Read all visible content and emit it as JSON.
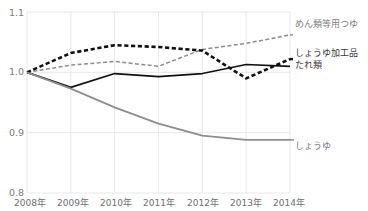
{
  "chart_data": {
    "type": "line",
    "title": "",
    "xlabel": "",
    "ylabel": "",
    "x": [
      "2008年",
      "2009年",
      "2010年",
      "2011年",
      "2012年",
      "2013年",
      "2014年"
    ],
    "ylim": [
      0.8,
      1.1
    ],
    "yticks": [
      0.8,
      0.9,
      1.0,
      1.1
    ],
    "ytick_labels": [
      "0.8",
      "0.9",
      "1.0",
      "1.1"
    ],
    "grid": true,
    "legend_position": "right-inline",
    "series": [
      {
        "name": "めん類等用つゆ",
        "style": "dashed",
        "color": "#8d8d8d",
        "values": [
          1.0,
          1.012,
          1.018,
          1.01,
          1.038,
          1.048,
          1.062
        ]
      },
      {
        "name": "しょうゆ加工品\nたれ類",
        "label_line1": "しょうゆ加工品",
        "label_line2": "たれ類",
        "style": "dashed-bold",
        "color": "#111111",
        "values": [
          1.0,
          1.032,
          1.045,
          1.042,
          1.036,
          0.99,
          1.022
        ]
      },
      {
        "name": "たれ類",
        "style": "solid",
        "color": "#111111",
        "values": [
          1.0,
          0.975,
          0.998,
          0.993,
          0.998,
          1.013,
          1.01
        ]
      },
      {
        "name": "しょうゆ",
        "style": "solid",
        "color": "#8d8d8d",
        "values": [
          1.0,
          0.973,
          0.942,
          0.915,
          0.895,
          0.888,
          0.888
        ]
      }
    ]
  },
  "axis": {
    "y_labels": [
      "1.1",
      "1.0",
      "0.9",
      "0.8"
    ],
    "x_labels": [
      "2008年",
      "2009年",
      "2010年",
      "2011年",
      "2012年",
      "2013年",
      "2014年"
    ]
  },
  "legend": {
    "men_tsuyu": "めん類等用つゆ",
    "shoyu_kakoHin": "しょうゆ加工品",
    "tare_rui": "たれ類",
    "shoyu": "しょうゆ"
  },
  "colors": {
    "dark_line": "#111111",
    "gray_line": "#8d8d8d",
    "grid": "#e8e8e8",
    "tick_text": "#7a7a7a",
    "label_text": "#3a3a3a"
  }
}
